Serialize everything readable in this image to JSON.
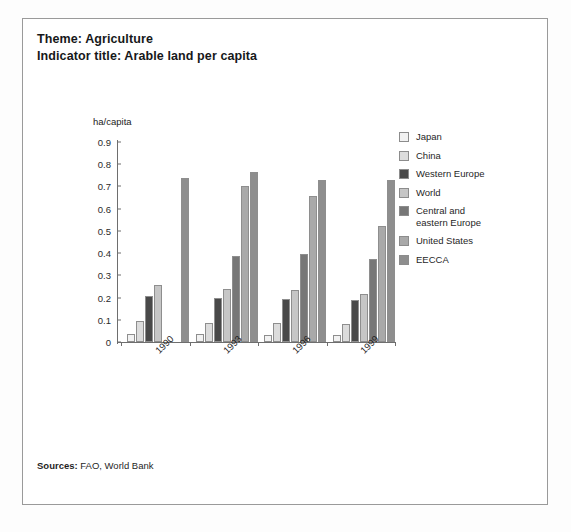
{
  "header": {
    "theme_line": "Theme: Agriculture",
    "indicator_line": "Indicator title: Arable land per capita"
  },
  "footer": {
    "sources_label": "Sources:",
    "sources_value": " FAO, World Bank"
  },
  "legend": {
    "items": [
      {
        "label": "Japan",
        "color": "#f2f2f2"
      },
      {
        "label": "China",
        "color": "#dcdcdc"
      },
      {
        "label": "Western Europe",
        "color": "#494949"
      },
      {
        "label": "World",
        "color": "#c6c6c6"
      },
      {
        "label": "Central and\neastern Europe",
        "color": "#777777"
      },
      {
        "label": "United States",
        "color": "#a9a9a9"
      },
      {
        "label": "EECCA",
        "color": "#8e8e8e"
      }
    ]
  },
  "chart_data": {
    "type": "bar",
    "title": "Arable land per capita",
    "xlabel": "",
    "ylabel": "ha/capita",
    "ylim": [
      0,
      0.9
    ],
    "yticks": [
      "0",
      "0.1",
      "0.2",
      "0.3",
      "0.4",
      "0.5",
      "0.6",
      "0.7",
      "0.8",
      "0.9"
    ],
    "ytick_values": [
      0,
      0.1,
      0.2,
      0.3,
      0.4,
      0.5,
      0.6,
      0.7,
      0.8,
      0.9
    ],
    "grid": false,
    "legend_position": "right",
    "categories": [
      "1990",
      "1993",
      "1996",
      "1999"
    ],
    "series": [
      {
        "name": "Japan",
        "color": "#f2f2f2",
        "values": [
          0.035,
          0.034,
          0.032,
          0.031
        ]
      },
      {
        "name": "China",
        "color": "#dcdcdc",
        "values": [
          0.094,
          0.087,
          0.084,
          0.08
        ]
      },
      {
        "name": "Western Europe",
        "color": "#494949",
        "values": [
          0.205,
          0.198,
          0.192,
          0.188
        ]
      },
      {
        "name": "World",
        "color": "#c6c6c6",
        "values": [
          0.255,
          0.24,
          0.232,
          0.218
        ]
      },
      {
        "name": "Central and eastern Europe",
        "color": "#777777",
        "values": [
          0.0,
          0.388,
          0.394,
          0.374
        ]
      },
      {
        "name": "United States",
        "color": "#a9a9a9",
        "values": [
          0.0,
          0.7,
          0.656,
          0.523
        ]
      },
      {
        "name": "EECCA",
        "color": "#8e8e8e",
        "values": [
          0.74,
          0.765,
          0.73,
          0.727
        ]
      }
    ]
  }
}
